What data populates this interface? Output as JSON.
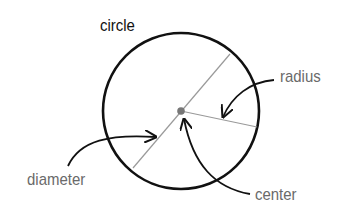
{
  "diagram": {
    "title": "circle",
    "labels": {
      "radius": "radius",
      "diameter": "diameter",
      "center": "center"
    },
    "colors": {
      "circle_stroke": "#111111",
      "line_stroke": "#9a9a9a",
      "center_dot": "#777777",
      "arrow_stroke": "#111111",
      "label_text": "#6a6a6a"
    },
    "geometry": {
      "circle": {
        "cx": 181,
        "cy": 111,
        "r": 78
      },
      "diameter": {
        "x1": 230,
        "y1": 54,
        "x2": 133,
        "y2": 168
      },
      "radius": {
        "x1": 181,
        "y1": 111,
        "x2": 257,
        "y2": 127
      }
    }
  }
}
